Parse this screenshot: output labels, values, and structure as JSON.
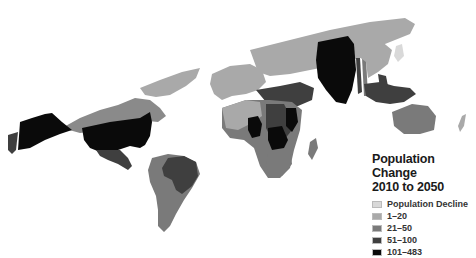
{
  "map": {
    "type": "choropleth",
    "projection": "world",
    "colors": {
      "decline": "#d9d9d9",
      "1_20": "#a9a9a9",
      "21_50": "#7a7a7a",
      "51_100": "#3f3f3f",
      "101_483": "#0a0a0a",
      "background": "#ffffff"
    }
  },
  "legend": {
    "title_line1": "Population Change",
    "title_line2": "2010 to 2050",
    "items": [
      {
        "label": "Population Decline",
        "color": "#d9d9d9"
      },
      {
        "label": "1–20",
        "color": "#a9a9a9"
      },
      {
        "label": "21–50",
        "color": "#7a7a7a"
      },
      {
        "label": "51–100",
        "color": "#3f3f3f"
      },
      {
        "label": "101–483",
        "color": "#0a0a0a"
      }
    ]
  }
}
